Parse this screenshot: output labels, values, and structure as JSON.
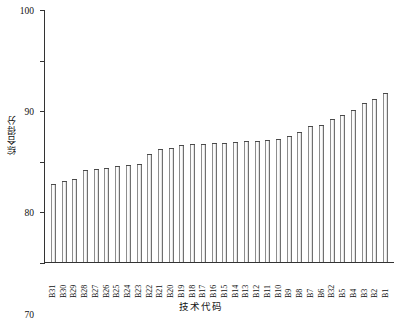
{
  "chart_data": {
    "type": "bar",
    "title": "",
    "xlabel": "技术代码",
    "ylabel": "综合得分",
    "ylim": [
      50,
      100
    ],
    "yticks": [
      50,
      60,
      70,
      80,
      90,
      100
    ],
    "grid": false,
    "legend": null,
    "categories": [
      "B31",
      "B30",
      "B29",
      "B28",
      "B27",
      "B26",
      "B25",
      "B24",
      "B23",
      "B22",
      "B21",
      "B20",
      "B19",
      "B18",
      "B17",
      "B16",
      "B15",
      "B14",
      "B13",
      "B12",
      "B11",
      "B10",
      "B9",
      "B8",
      "B7",
      "B6",
      "B32",
      "B5",
      "B4",
      "B3",
      "B2",
      "B1"
    ],
    "values": [
      65.4,
      66.1,
      66.4,
      68.1,
      68.3,
      68.5,
      69.0,
      69.2,
      69.3,
      71.4,
      72.4,
      72.5,
      73.1,
      73.3,
      73.4,
      73.5,
      73.6,
      73.7,
      73.9,
      74.0,
      74.2,
      74.4,
      75.0,
      75.6,
      76.9,
      77.1,
      78.3,
      79.0,
      80.1,
      81.4,
      82.2,
      83.4
    ]
  },
  "caption": "技术代码"
}
